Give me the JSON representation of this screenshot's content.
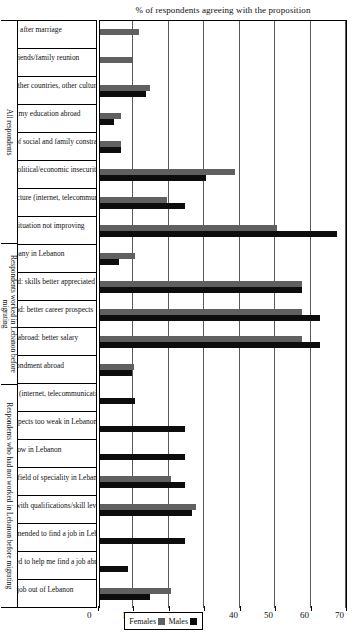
{
  "chart_data": {
    "type": "bar",
    "title": "",
    "ylabel": "% of respondents agreeing with the proposition",
    "xlabel": "",
    "ylim": [
      0,
      70
    ],
    "yticks": [
      0,
      10,
      20,
      30,
      40,
      50,
      60,
      70
    ],
    "grid": true,
    "legend_position": "right",
    "orientation": "vertical-rotated",
    "legend": [
      "Males",
      "Females"
    ],
    "colors": {
      "males": "#0d0d0d",
      "females": "#606060"
    },
    "categories": [
      "Left Lebanon after marriage",
      "Left Lebanon for friends/family reunion",
      "Left Lebanon to discover other countries, other cultures",
      "Wanted to continue my education abroad",
      "Left Lebanon as a rejection of social and family constraints",
      "Left Lebanon for fear of political/economic insecurity",
      "Bad quality of technical infrastructure (internet, telecommunication)",
      "Economic/financial situation not improving",
      "Lost job/company in Lebanon",
      "Found a better job abroad: skills better appreciated",
      "Found a better job abroad: better career prospects",
      "Found a better job abroad: better salary",
      "Company secondment abroad",
      "Bad quality of infrastructure (internet, telecommunication)",
      "Career advancement prospects too weak in Lebanon",
      "Salaries too low in Lebanon",
      "No job opportunities in my field of speciality in Lebanon",
      "Job offers not compatible with qualifications/skill level",
      "Could not be helped or recommended to find a job in Lebanon",
      "Friend/family member offered to help me find a job abroad",
      "Directly found a job out of Lebanon"
    ],
    "series": [
      {
        "name": "Males",
        "values": [
          0,
          0,
          13,
          4,
          6,
          30,
          24,
          67,
          5.5,
          57,
          62,
          62,
          9,
          10,
          24,
          24,
          24,
          26,
          24,
          8,
          14
        ]
      },
      {
        "name": "Females",
        "values": [
          11,
          9,
          14,
          6,
          6,
          38,
          19,
          50,
          10,
          57,
          57,
          57,
          9.5,
          0,
          0,
          0,
          20,
          27,
          0,
          0,
          20
        ]
      }
    ],
    "groups": [
      {
        "label": "All respondents",
        "span": 8
      },
      {
        "label": "Respondents worked in Lebanon before migrating",
        "span": 5
      },
      {
        "label": "Respondents who had not worked in Lebanon before migrating",
        "span": 8
      }
    ]
  }
}
